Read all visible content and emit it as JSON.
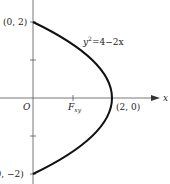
{
  "figure": {
    "equation_label": "y² = 4 − 2x",
    "equation_parts": {
      "y": "y",
      "exp": "2",
      "rest": "=4−2x"
    },
    "axis_x_label": "x",
    "origin_label": "O",
    "focus_label": {
      "main": "F",
      "sub": "xy"
    },
    "points": [
      {
        "label": "(0, 2)",
        "x": 0,
        "y": 2
      },
      {
        "label": "(2, 0)",
        "x": 2,
        "y": 0
      },
      {
        "label": "(0, −2)",
        "x": 0,
        "y": -2
      }
    ],
    "curve": {
      "type": "parabola",
      "equation": "y^2 = 4 - 2x",
      "domain_y": [
        -2,
        2
      ]
    },
    "colors": {
      "curve": "#111111",
      "axis": "#444444",
      "text": "#222222"
    }
  }
}
